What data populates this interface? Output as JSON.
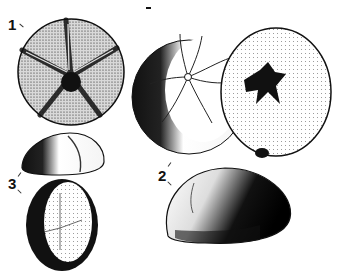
{
  "figure": {
    "labels": [
      {
        "id": "1",
        "text": "1"
      },
      {
        "id": "2",
        "text": "2"
      },
      {
        "id": "3",
        "text": "3"
      }
    ],
    "specimens": [
      {
        "label": "1",
        "view": "aboral view, five-petaled ambulacra"
      },
      {
        "label": "2",
        "view": "aboral view with petaloid star, oral view with dark star-shaped mouth, lateral view"
      },
      {
        "label": "3",
        "view": "lateral view and aboral view of oval specimen"
      }
    ],
    "colors": {
      "ink": "#111111",
      "paper": "#ffffff"
    }
  }
}
